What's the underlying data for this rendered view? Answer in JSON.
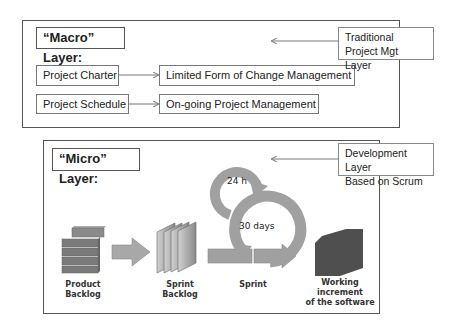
{
  "macro": {
    "title": "“Macro” Layer:",
    "note": "Traditional\nProject Mgt Layer",
    "rows": [
      {
        "source": "Project Charter",
        "target": "Limited Form of Change Management"
      },
      {
        "source": "Project Schedule",
        "target": "On-going Project Management"
      }
    ]
  },
  "micro": {
    "title": "“Micro” Layer:",
    "note": "Development Layer\nBased on Scrum",
    "daily_cycle": "24 h",
    "sprint_cycle": "30 days",
    "stages": [
      {
        "label": "Product Backlog"
      },
      {
        "label": "Sprint Backlog"
      },
      {
        "label": "Sprint"
      },
      {
        "label": "Working increment\nof the software"
      }
    ]
  },
  "colors": {
    "frame": "#555555",
    "shape_gray": "#9a9a9a",
    "shape_dark": "#555555",
    "backlog_gray": "#7a7a7a"
  }
}
